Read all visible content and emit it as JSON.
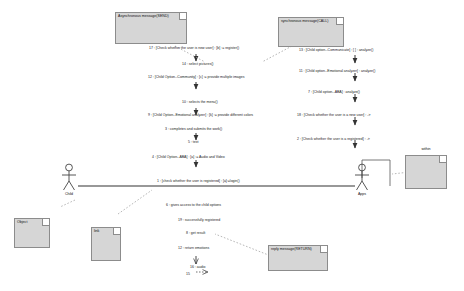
{
  "diagram": {
    "type": "communication-diagram",
    "colors": {
      "note_fill": "#d6d6d6",
      "note_border": "#8c8c8c",
      "line": "#555555",
      "text": "#111111"
    }
  },
  "notes": [
    {
      "id": "note-async",
      "label": "Asynchronous message(SEND)"
    },
    {
      "id": "note-sync",
      "label": "synchronous message(CALL)"
    },
    {
      "id": "note-object",
      "label": "Object"
    },
    {
      "id": "note-link",
      "label": "link"
    },
    {
      "id": "note-reply",
      "label": "reply message(RETURN)"
    }
  ],
  "actors": [
    {
      "id": "actor-child",
      "label": "Child"
    },
    {
      "id": "actor-apps",
      "label": "Apps"
    },
    {
      "id": "actor-within",
      "label": "within"
    }
  ],
  "messages": [
    {
      "num": "17",
      "text": "17 : [Check whether the user is new user] : [b] := register()"
    },
    {
      "num": "14",
      "text": "14 : select pictures()"
    },
    {
      "num": "12",
      "text": "12 : [Child Option--Community] : [c] := provide multiple images"
    },
    {
      "num": "10",
      "text": "10 : selects the menu()"
    },
    {
      "num": "9",
      "text": "9 : [Child Option--Emotional analyzer] : [k] := provide different colors"
    },
    {
      "num": "3",
      "text": "3 : completes and submits the work()"
    },
    {
      "num": "5",
      "text": "5 : text"
    },
    {
      "num": "4",
      "text": "4 : [Child Option--ABA] : [a] := Audio and Video"
    },
    {
      "num": "1",
      "text": "1 : [check whether the user is registered] : [a]:=login()"
    },
    {
      "num": "13",
      "text": "13 : [Child option--Communicate] : [ ] : analyze()"
    },
    {
      "num": "11",
      "text": "11 : [Child option--Emotional analyzer] : analyze()"
    },
    {
      "num": "7",
      "text": "7 : [Child option--ABA] : analyze()"
    },
    {
      "num": "18",
      "text": "18 : [Check whether the user is a new user] : ->"
    },
    {
      "num": "2",
      "text": "2 : [Check whether the user is a registered] : ->"
    },
    {
      "num": "6",
      "text": "6 : gives access to the child options"
    },
    {
      "num": "19",
      "text": "19 : successfully registered"
    },
    {
      "num": "8",
      "text": "8 : get result"
    },
    {
      "num": "12b",
      "text": "12 : return emotions"
    },
    {
      "num": "16",
      "text": "16 : audio"
    },
    {
      "num": "15",
      "text": "15"
    }
  ]
}
